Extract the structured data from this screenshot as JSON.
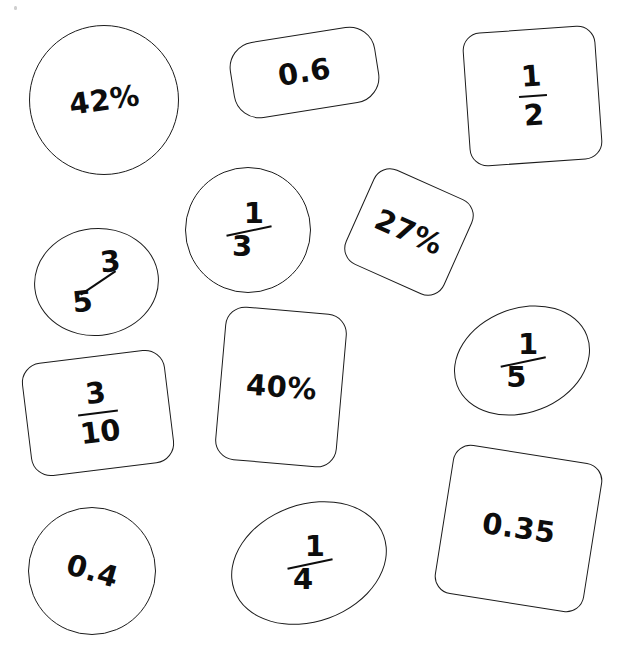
{
  "page": {
    "background_color": "#ffffff",
    "outline_color": "#1b1b1b",
    "text_color": "#0d0d0d",
    "width": 643,
    "height": 667
  },
  "cards": [
    {
      "id": "card-42-percent",
      "shape": "circle",
      "value": "42%",
      "kind": "percentage",
      "text_rotation": -8
    },
    {
      "id": "card-0-6",
      "shape": "rounded-pill",
      "value": "0.6",
      "kind": "decimal",
      "text_rotation": -9
    },
    {
      "id": "card-1-2",
      "shape": "rounded-square",
      "value": "1/2",
      "numerator": "1",
      "denominator": "2",
      "kind": "fraction",
      "text_rotation": -4
    },
    {
      "id": "card-3-5",
      "shape": "ellipse",
      "value": "3/5",
      "numerator": "3",
      "denominator": "5",
      "kind": "fraction",
      "text_rotation": 0
    },
    {
      "id": "card-1-3",
      "shape": "circle",
      "value": "1/3",
      "numerator": "1",
      "denominator": "3",
      "kind": "fraction",
      "text_rotation": 0
    },
    {
      "id": "card-27-percent",
      "shape": "rounded-square",
      "value": "27%",
      "kind": "percentage",
      "text_rotation": 24
    },
    {
      "id": "card-3-10",
      "shape": "rounded-rect",
      "value": "3/10",
      "numerator": "3",
      "denominator": "10",
      "kind": "fraction",
      "text_rotation": -7
    },
    {
      "id": "card-40-percent",
      "shape": "rounded-rect",
      "value": "40%",
      "kind": "percentage",
      "text_rotation": 5
    },
    {
      "id": "card-1-5",
      "shape": "ellipse",
      "value": "1/5",
      "numerator": "1",
      "denominator": "5",
      "kind": "fraction",
      "text_rotation": 0
    },
    {
      "id": "card-0-4",
      "shape": "circle",
      "value": "0.4",
      "kind": "decimal",
      "text_rotation": 16
    },
    {
      "id": "card-1-4",
      "shape": "ellipse",
      "value": "1/4",
      "numerator": "1",
      "denominator": "4",
      "kind": "fraction",
      "text_rotation": 0
    },
    {
      "id": "card-0-35",
      "shape": "rounded-square",
      "value": "0.35",
      "kind": "decimal",
      "text_rotation": 9
    }
  ]
}
